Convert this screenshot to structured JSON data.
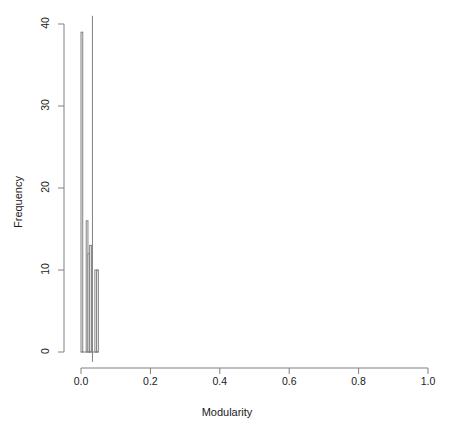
{
  "chart_data": {
    "type": "bar",
    "title": "",
    "xlabel": "Modularity",
    "ylabel": "Frequency",
    "xlim": [
      0.0,
      1.0
    ],
    "ylim": [
      0,
      40
    ],
    "xticks": [
      0.0,
      0.2,
      0.4,
      0.6,
      0.8,
      1.0
    ],
    "xtick_labels": [
      "0.0",
      "0.2",
      "0.4",
      "0.6",
      "0.8",
      "1.0"
    ],
    "yticks": [
      0,
      10,
      20,
      30,
      40
    ],
    "ytick_labels": [
      "0",
      "10",
      "20",
      "30",
      "40"
    ],
    "grid": false,
    "legend": null,
    "bin_width": 0.005,
    "bin_edges": [
      0.0,
      0.005,
      0.01,
      0.015,
      0.02,
      0.025,
      0.03,
      0.035,
      0.04,
      0.045,
      0.05,
      0.055
    ],
    "categories": [
      "0.000-0.005",
      "0.005-0.010",
      "0.010-0.015",
      "0.015-0.020",
      "0.020-0.025",
      "0.025-0.030",
      "0.030-0.035",
      "0.035-0.040",
      "0.040-0.045",
      "0.045-0.050",
      "0.050-0.055"
    ],
    "values": [
      39,
      0,
      0,
      16,
      12,
      13,
      0,
      0,
      10,
      10,
      0
    ],
    "bars": [
      {
        "x0": 0.0,
        "x1": 0.005,
        "height": 39
      },
      {
        "x0": 0.015,
        "x1": 0.02,
        "height": 16
      },
      {
        "x0": 0.02,
        "x1": 0.025,
        "height": 12
      },
      {
        "x0": 0.025,
        "x1": 0.03,
        "height": 13
      },
      {
        "x0": 0.04,
        "x1": 0.045,
        "height": 10
      },
      {
        "x0": 0.045,
        "x1": 0.05,
        "height": 10
      }
    ],
    "reference_line": {
      "x": 0.033,
      "y_top": 41,
      "y_bottom": -1.2
    },
    "bar_fill": "#ffffff",
    "bar_stroke": "#808080",
    "axis_color": "#808080"
  },
  "colors": {
    "background": "#ffffff",
    "text": "#1a1a1a",
    "axis": "#808080",
    "bar_stroke": "#808080",
    "bar_fill": "#ffffff"
  }
}
